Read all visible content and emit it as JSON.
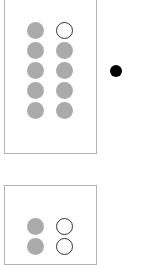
{
  "panels": [
    {
      "name": "panel-1",
      "box": {
        "x": 4,
        "y": -2,
        "w": 93,
        "h": 156
      },
      "grid": {
        "x0": 27,
        "y0": 22,
        "dx": 29,
        "dy": 20
      },
      "dots": [
        [
          "filled",
          "empty"
        ],
        [
          "filled",
          "filled"
        ],
        [
          "filled",
          "filled"
        ],
        [
          "filled",
          "filled"
        ],
        [
          "filled",
          "filled"
        ]
      ],
      "marker": {
        "x": 110,
        "y": 65
      }
    },
    {
      "name": "panel-2",
      "box": {
        "x": 4,
        "y": 185,
        "w": 93,
        "h": 80
      },
      "grid": {
        "x0": 27,
        "y0": 218,
        "dx": 29,
        "dy": 20
      },
      "dots": [
        [
          "filled",
          "empty"
        ],
        [
          "filled",
          "empty"
        ]
      ]
    }
  ],
  "colors": {
    "filled": "#aaaaaa",
    "empty_stroke": "#333333",
    "border": "#b3b3b3",
    "marker": "#000000"
  }
}
